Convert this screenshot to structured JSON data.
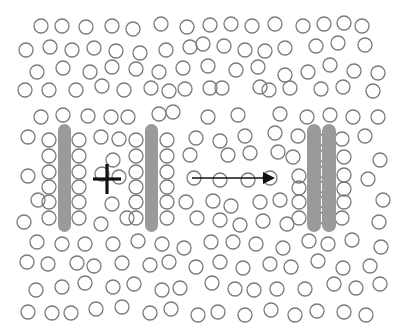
{
  "diagram": {
    "colors": {
      "background": "#ffffff",
      "particle_stroke": "#7a7a7a",
      "plate_fill": "#9a9a9a",
      "symbol": "#111111"
    },
    "particle_radius": 7,
    "plates": [
      {
        "name": "plate-left",
        "x": 58,
        "y": 124,
        "width": 13,
        "height": 108
      },
      {
        "name": "plate-middle",
        "x": 145,
        "y": 124,
        "width": 13,
        "height": 108
      },
      {
        "name": "plate-right-a",
        "x": 307,
        "y": 124,
        "width": 14,
        "height": 108
      },
      {
        "name": "plate-right-b",
        "x": 322,
        "y": 124,
        "width": 14,
        "height": 108
      }
    ],
    "cross": {
      "symbol": "plus",
      "cx": 107,
      "cy": 179,
      "half_width": 14,
      "half_height": 15
    },
    "arrow": {
      "x1": 192,
      "y1": 178,
      "x2": 275,
      "y2": 178,
      "direction": "right"
    },
    "particles": [
      [
        41,
        26
      ],
      [
        62,
        26
      ],
      [
        86,
        27
      ],
      [
        112,
        26
      ],
      [
        133,
        29
      ],
      [
        161,
        24
      ],
      [
        187,
        27
      ],
      [
        210,
        25
      ],
      [
        231,
        24
      ],
      [
        252,
        26
      ],
      [
        275,
        24
      ],
      [
        303,
        26
      ],
      [
        324,
        24
      ],
      [
        344,
        23
      ],
      [
        362,
        26
      ],
      [
        26,
        50
      ],
      [
        50,
        47
      ],
      [
        72,
        50
      ],
      [
        94,
        48
      ],
      [
        116,
        51
      ],
      [
        140,
        53
      ],
      [
        166,
        50
      ],
      [
        190,
        47
      ],
      [
        203,
        44
      ],
      [
        224,
        46
      ],
      [
        245,
        50
      ],
      [
        265,
        51
      ],
      [
        285,
        48
      ],
      [
        316,
        46
      ],
      [
        338,
        43
      ],
      [
        365,
        45
      ],
      [
        37,
        72
      ],
      [
        63,
        68
      ],
      [
        90,
        72
      ],
      [
        112,
        67
      ],
      [
        136,
        69
      ],
      [
        159,
        72
      ],
      [
        183,
        68
      ],
      [
        208,
        66
      ],
      [
        236,
        70
      ],
      [
        258,
        67
      ],
      [
        285,
        75
      ],
      [
        308,
        72
      ],
      [
        330,
        65
      ],
      [
        354,
        71
      ],
      [
        378,
        73
      ],
      [
        25,
        90
      ],
      [
        49,
        90
      ],
      [
        76,
        90
      ],
      [
        102,
        86
      ],
      [
        124,
        90
      ],
      [
        151,
        88
      ],
      [
        169,
        91
      ],
      [
        185,
        89
      ],
      [
        210,
        88
      ],
      [
        222,
        88
      ],
      [
        260,
        87
      ],
      [
        269,
        90
      ],
      [
        290,
        88
      ],
      [
        321,
        89
      ],
      [
        343,
        87
      ],
      [
        373,
        91
      ],
      [
        41,
        117
      ],
      [
        63,
        115
      ],
      [
        88,
        116
      ],
      [
        111,
        117
      ],
      [
        128,
        117
      ],
      [
        159,
        114
      ],
      [
        173,
        112
      ],
      [
        208,
        117
      ],
      [
        238,
        115
      ],
      [
        280,
        114
      ],
      [
        307,
        117
      ],
      [
        330,
        115
      ],
      [
        353,
        117
      ],
      [
        378,
        117
      ],
      [
        28,
        137
      ],
      [
        49,
        140
      ],
      [
        79,
        140
      ],
      [
        101,
        137
      ],
      [
        119,
        139
      ],
      [
        136,
        140
      ],
      [
        167,
        140
      ],
      [
        196,
        138
      ],
      [
        220,
        141
      ],
      [
        245,
        136
      ],
      [
        275,
        133
      ],
      [
        298,
        136
      ],
      [
        317,
        140
      ],
      [
        342,
        139
      ],
      [
        365,
        136
      ],
      [
        49,
        156
      ],
      [
        79,
        156
      ],
      [
        113,
        160
      ],
      [
        136,
        156
      ],
      [
        167,
        156
      ],
      [
        190,
        155
      ],
      [
        228,
        155
      ],
      [
        250,
        153
      ],
      [
        278,
        152
      ],
      [
        293,
        157
      ],
      [
        317,
        156
      ],
      [
        344,
        157
      ],
      [
        380,
        160
      ],
      [
        28,
        176
      ],
      [
        49,
        172
      ],
      [
        79,
        172
      ],
      [
        102,
        174
      ],
      [
        119,
        177
      ],
      [
        136,
        172
      ],
      [
        167,
        172
      ],
      [
        194,
        178
      ],
      [
        220,
        180
      ],
      [
        248,
        180
      ],
      [
        270,
        178
      ],
      [
        299,
        176
      ],
      [
        317,
        172
      ],
      [
        344,
        175
      ],
      [
        368,
        179
      ],
      [
        38,
        200
      ],
      [
        49,
        187
      ],
      [
        79,
        187
      ],
      [
        136,
        187
      ],
      [
        167,
        187
      ],
      [
        299,
        188
      ],
      [
        317,
        187
      ],
      [
        344,
        189
      ],
      [
        49,
        202
      ],
      [
        79,
        202
      ],
      [
        112,
        204
      ],
      [
        136,
        202
      ],
      [
        167,
        202
      ],
      [
        186,
        202
      ],
      [
        213,
        201
      ],
      [
        231,
        206
      ],
      [
        260,
        202
      ],
      [
        280,
        200
      ],
      [
        299,
        202
      ],
      [
        317,
        202
      ],
      [
        344,
        202
      ],
      [
        383,
        200
      ],
      [
        24,
        222
      ],
      [
        49,
        218
      ],
      [
        79,
        218
      ],
      [
        101,
        224
      ],
      [
        127,
        218
      ],
      [
        136,
        218
      ],
      [
        167,
        218
      ],
      [
        197,
        218
      ],
      [
        220,
        220
      ],
      [
        240,
        225
      ],
      [
        263,
        221
      ],
      [
        287,
        224
      ],
      [
        299,
        218
      ],
      [
        317,
        218
      ],
      [
        342,
        218
      ],
      [
        379,
        222
      ],
      [
        37,
        242
      ],
      [
        62,
        244
      ],
      [
        85,
        244
      ],
      [
        113,
        244
      ],
      [
        138,
        241
      ],
      [
        162,
        244
      ],
      [
        184,
        248
      ],
      [
        211,
        242
      ],
      [
        233,
        242
      ],
      [
        256,
        244
      ],
      [
        283,
        248
      ],
      [
        309,
        241
      ],
      [
        328,
        244
      ],
      [
        352,
        240
      ],
      [
        381,
        247
      ],
      [
        27,
        262
      ],
      [
        48,
        264
      ],
      [
        77,
        263
      ],
      [
        94,
        266
      ],
      [
        122,
        263
      ],
      [
        150,
        265
      ],
      [
        169,
        262
      ],
      [
        196,
        267
      ],
      [
        220,
        262
      ],
      [
        243,
        268
      ],
      [
        270,
        264
      ],
      [
        291,
        267
      ],
      [
        318,
        261
      ],
      [
        343,
        268
      ],
      [
        370,
        266
      ],
      [
        36,
        290
      ],
      [
        62,
        287
      ],
      [
        85,
        283
      ],
      [
        113,
        287
      ],
      [
        134,
        284
      ],
      [
        162,
        290
      ],
      [
        180,
        288
      ],
      [
        212,
        283
      ],
      [
        235,
        289
      ],
      [
        254,
        290
      ],
      [
        277,
        289
      ],
      [
        305,
        289
      ],
      [
        334,
        284
      ],
      [
        356,
        288
      ],
      [
        380,
        284
      ],
      [
        28,
        312
      ],
      [
        52,
        313
      ],
      [
        71,
        313
      ],
      [
        96,
        309
      ],
      [
        122,
        307
      ],
      [
        150,
        313
      ],
      [
        171,
        309
      ],
      [
        198,
        315
      ],
      [
        218,
        312
      ],
      [
        245,
        315
      ],
      [
        271,
        310
      ],
      [
        295,
        315
      ],
      [
        317,
        311
      ],
      [
        344,
        312
      ],
      [
        366,
        315
      ]
    ]
  }
}
